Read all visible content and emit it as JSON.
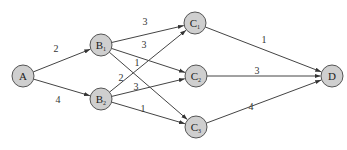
{
  "diagram": {
    "type": "directed-weighted-graph",
    "nodes": [
      {
        "id": "A",
        "label": "A",
        "sub": "",
        "x": 23,
        "y": 76
      },
      {
        "id": "B1",
        "label": "B",
        "sub": "1",
        "x": 101,
        "y": 45
      },
      {
        "id": "B2",
        "label": "B",
        "sub": "2",
        "x": 101,
        "y": 99
      },
      {
        "id": "C1",
        "label": "C",
        "sub": "1",
        "x": 195,
        "y": 23
      },
      {
        "id": "C2",
        "label": "C",
        "sub": "2",
        "x": 196,
        "y": 76
      },
      {
        "id": "C3",
        "label": "C",
        "sub": "3",
        "x": 196,
        "y": 127
      },
      {
        "id": "D",
        "label": "D",
        "sub": "",
        "x": 332,
        "y": 76
      }
    ],
    "edges": [
      {
        "from": "A",
        "to": "B1",
        "weight": "2",
        "lx": 56,
        "ly": 52
      },
      {
        "from": "A",
        "to": "B2",
        "weight": "4",
        "lx": 58,
        "ly": 103
      },
      {
        "from": "B1",
        "to": "C1",
        "weight": "3",
        "lx": 145,
        "ly": 25
      },
      {
        "from": "B1",
        "to": "C2",
        "weight": "3",
        "lx": 144,
        "ly": 48
      },
      {
        "from": "B1",
        "to": "C3",
        "weight": "1",
        "lx": 137,
        "ly": 66
      },
      {
        "from": "B2",
        "to": "C1",
        "weight": "2",
        "lx": 121,
        "ly": 81
      },
      {
        "from": "B2",
        "to": "C2",
        "weight": "3",
        "lx": 136,
        "ly": 90
      },
      {
        "from": "B2",
        "to": "C3",
        "weight": "1",
        "lx": 143,
        "ly": 112
      },
      {
        "from": "C1",
        "to": "D",
        "weight": "1",
        "lx": 264,
        "ly": 43
      },
      {
        "from": "C2",
        "to": "D",
        "weight": "3",
        "lx": 257,
        "ly": 74
      },
      {
        "from": "C3",
        "to": "D",
        "weight": "4",
        "lx": 251,
        "ly": 110
      }
    ],
    "node_radius": 11,
    "colors": {
      "node_fill": "#cfcfcf",
      "node_stroke": "#555555",
      "edge": "#444444"
    }
  }
}
